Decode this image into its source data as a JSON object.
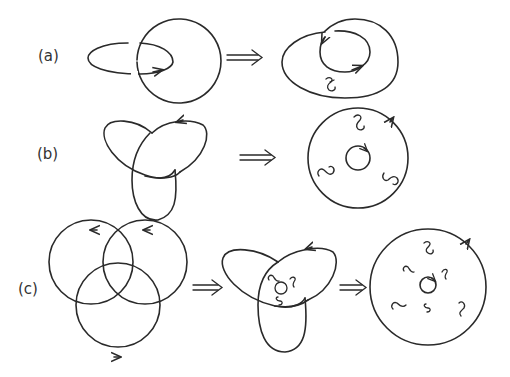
{
  "figure": {
    "rows": [
      {
        "id": "a",
        "label": "(a)",
        "description": "Hopf link to disk with one twist"
      },
      {
        "id": "b",
        "label": "(b)",
        "description": "Trefoil knot to disk with three twists"
      },
      {
        "id": "c",
        "label": "(c)",
        "description": "Borromean rings to trefoil-like surface to disk with six twists"
      }
    ],
    "arrow_symbol": "⟹",
    "colors": {
      "ink": "#2a2a2a",
      "background": "#ffffff"
    }
  }
}
